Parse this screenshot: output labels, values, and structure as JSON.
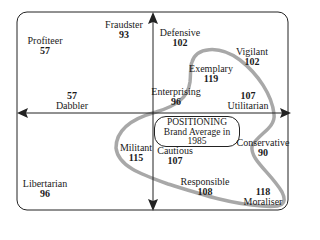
{
  "diagram": {
    "type": "brand-positioning-map",
    "positioning_box": {
      "line1": "POSITIONING",
      "line2": "Brand Average in",
      "line3": "1985"
    },
    "segments": [
      {
        "name": "Profiteer",
        "score": "57",
        "order": "name-first"
      },
      {
        "name": "Fraudster",
        "score": "93",
        "order": "name-first"
      },
      {
        "name": "Defensive",
        "score": "102",
        "order": "name-first"
      },
      {
        "name": "Vigilant",
        "score": "102",
        "order": "name-first"
      },
      {
        "name": "Exemplary",
        "score": "119",
        "order": "name-first"
      },
      {
        "name": "Enterprising",
        "score": "96",
        "order": "name-first"
      },
      {
        "name": "Utilitarian",
        "score": "107",
        "order": "score-first"
      },
      {
        "name": "Dabbler",
        "score": "57",
        "order": "score-first"
      },
      {
        "name": "Militant",
        "score": "115",
        "order": "name-first"
      },
      {
        "name": "Cautious",
        "score": "107",
        "order": "name-first"
      },
      {
        "name": "Conservative",
        "score": "90",
        "order": "name-first"
      },
      {
        "name": "Responsible",
        "score": "108",
        "order": "name-first"
      },
      {
        "name": "Moraliser",
        "score": "118",
        "order": "score-first"
      },
      {
        "name": "Libertarian",
        "score": "96",
        "order": "name-first"
      }
    ],
    "colors": {
      "frame": "#222222",
      "axes": "#222222",
      "curve": "#a8a8a8"
    }
  }
}
